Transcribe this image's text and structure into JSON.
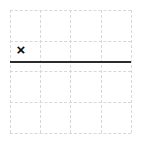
{
  "canvas": {
    "width": 141,
    "height": 144,
    "background_color": "#ffffff"
  },
  "grid": {
    "columns": 4,
    "rows": 4,
    "left": 10,
    "top": 10,
    "right": 131,
    "bottom": 133,
    "cell_width": 30.25,
    "cell_height": 30.75,
    "line_style": "dashed",
    "line_color": "#d8d8d8",
    "line_width": 1,
    "vertical_positions": [
      10,
      40.25,
      70.5,
      100.75,
      131
    ],
    "horizontal_positions": [
      10,
      40.75,
      71.5,
      102.25,
      133
    ]
  },
  "solid_line": {
    "label": "horizontal-rule",
    "orientation": "horizontal",
    "x_start": 10,
    "x_end": 131,
    "y": 61,
    "thickness": 2,
    "color": "#2b2b2b",
    "style": "solid"
  },
  "markers": [
    {
      "label": "x-mark",
      "glyph": "×",
      "center_x": 21,
      "center_y": 49,
      "font_size": 15,
      "color": "#0a0a0a",
      "grid_column": 1,
      "grid_row": 2
    }
  ]
}
